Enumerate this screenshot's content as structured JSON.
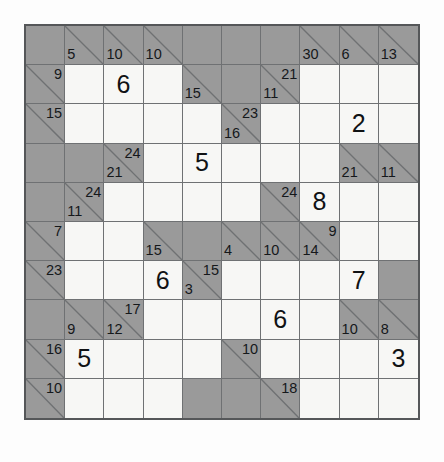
{
  "puzzle": {
    "title": "Kakuro",
    "rows": 10,
    "cols": 10,
    "colors": {
      "page_background": "#fdfdfd",
      "clue_cell": "#9a9a9a",
      "open_cell": "#f7f7f5",
      "grid_line": "#6f7173",
      "outer_border": "#555759",
      "text": "#15181b"
    }
  },
  "chart_data": {
    "type": "table",
    "rows": 10,
    "cols": 10,
    "legend": {
      "block": "solid shaded cell, no clue",
      "clue": "shaded cell with diagonal; across clue top-right, down clue bottom-left",
      "open": "white entry cell, may contain a given digit"
    },
    "cells": [
      [
        {
          "kind": "block"
        },
        {
          "kind": "clue",
          "down": "5"
        },
        {
          "kind": "clue",
          "down": "10"
        },
        {
          "kind": "clue",
          "down": "10"
        },
        {
          "kind": "block"
        },
        {
          "kind": "block"
        },
        {
          "kind": "block"
        },
        {
          "kind": "clue",
          "down": "30"
        },
        {
          "kind": "clue",
          "down": "6"
        },
        {
          "kind": "clue",
          "down": "13"
        }
      ],
      [
        {
          "kind": "clue",
          "across": "9"
        },
        {
          "kind": "open"
        },
        {
          "kind": "open",
          "value": "6"
        },
        {
          "kind": "open"
        },
        {
          "kind": "clue",
          "down": "15"
        },
        {
          "kind": "block"
        },
        {
          "kind": "clue",
          "across": "21",
          "down": "11"
        },
        {
          "kind": "open"
        },
        {
          "kind": "open"
        },
        {
          "kind": "open"
        }
      ],
      [
        {
          "kind": "clue",
          "across": "15"
        },
        {
          "kind": "open"
        },
        {
          "kind": "open"
        },
        {
          "kind": "open"
        },
        {
          "kind": "open"
        },
        {
          "kind": "clue",
          "across": "23",
          "down": "16"
        },
        {
          "kind": "open"
        },
        {
          "kind": "open"
        },
        {
          "kind": "open",
          "value": "2"
        },
        {
          "kind": "open"
        }
      ],
      [
        {
          "kind": "block"
        },
        {
          "kind": "block"
        },
        {
          "kind": "clue",
          "across": "24",
          "down": "21"
        },
        {
          "kind": "open"
        },
        {
          "kind": "open",
          "value": "5"
        },
        {
          "kind": "open"
        },
        {
          "kind": "open"
        },
        {
          "kind": "open"
        },
        {
          "kind": "clue",
          "down": "21"
        },
        {
          "kind": "clue",
          "down": "11"
        }
      ],
      [
        {
          "kind": "block"
        },
        {
          "kind": "clue",
          "across": "24",
          "down": "11"
        },
        {
          "kind": "open"
        },
        {
          "kind": "open"
        },
        {
          "kind": "open"
        },
        {
          "kind": "open"
        },
        {
          "kind": "clue",
          "across": "24"
        },
        {
          "kind": "open",
          "value": "8"
        },
        {
          "kind": "open"
        },
        {
          "kind": "open"
        }
      ],
      [
        {
          "kind": "clue",
          "across": "7"
        },
        {
          "kind": "open"
        },
        {
          "kind": "open"
        },
        {
          "kind": "clue",
          "down": "15"
        },
        {
          "kind": "block"
        },
        {
          "kind": "clue",
          "down": "4"
        },
        {
          "kind": "clue",
          "down": "10"
        },
        {
          "kind": "clue",
          "across": "9",
          "down": "14"
        },
        {
          "kind": "open"
        },
        {
          "kind": "open"
        }
      ],
      [
        {
          "kind": "clue",
          "across": "23"
        },
        {
          "kind": "open"
        },
        {
          "kind": "open"
        },
        {
          "kind": "open",
          "value": "6"
        },
        {
          "kind": "clue",
          "across": "15",
          "down": "3"
        },
        {
          "kind": "open"
        },
        {
          "kind": "open"
        },
        {
          "kind": "open"
        },
        {
          "kind": "open",
          "value": "7"
        },
        {
          "kind": "block"
        }
      ],
      [
        {
          "kind": "block"
        },
        {
          "kind": "clue",
          "down": "9"
        },
        {
          "kind": "clue",
          "across": "17",
          "down": "12"
        },
        {
          "kind": "open"
        },
        {
          "kind": "open"
        },
        {
          "kind": "open"
        },
        {
          "kind": "open",
          "value": "6"
        },
        {
          "kind": "open"
        },
        {
          "kind": "clue",
          "down": "10"
        },
        {
          "kind": "clue",
          "down": "8"
        }
      ],
      [
        {
          "kind": "clue",
          "across": "16"
        },
        {
          "kind": "open",
          "value": "5"
        },
        {
          "kind": "open"
        },
        {
          "kind": "open"
        },
        {
          "kind": "open"
        },
        {
          "kind": "clue",
          "across": "10"
        },
        {
          "kind": "open"
        },
        {
          "kind": "open"
        },
        {
          "kind": "open"
        },
        {
          "kind": "open",
          "value": "3"
        }
      ],
      [
        {
          "kind": "clue",
          "across": "10"
        },
        {
          "kind": "open"
        },
        {
          "kind": "open"
        },
        {
          "kind": "open"
        },
        {
          "kind": "block"
        },
        {
          "kind": "block"
        },
        {
          "kind": "clue",
          "across": "18"
        },
        {
          "kind": "open"
        },
        {
          "kind": "open"
        },
        {
          "kind": "open"
        }
      ]
    ]
  }
}
